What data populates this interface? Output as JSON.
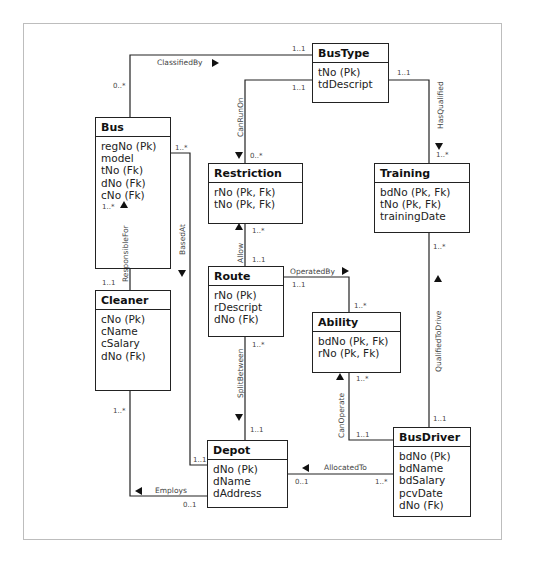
{
  "diagram": {
    "type": "UML class diagram (ER)",
    "entities": {
      "bus": {
        "name": "Bus",
        "attributes": [
          "regNo (Pk)",
          "model",
          "tNo (Fk)",
          "dNo (Fk)",
          "cNo (Fk)"
        ]
      },
      "bustype": {
        "name": "BusType",
        "attributes": [
          "tNo (Pk)",
          "tdDescript"
        ]
      },
      "restriction": {
        "name": "Restriction",
        "attributes": [
          "rNo (Pk, Fk)",
          "tNo (Pk, Fk)"
        ]
      },
      "training": {
        "name": "Training",
        "attributes": [
          "bdNo (Pk, Fk)",
          "tNo (Pk, Fk)",
          "trainingDate"
        ]
      },
      "route": {
        "name": "Route",
        "attributes": [
          "rNo (Pk)",
          "rDescript",
          "dNo (Fk)"
        ]
      },
      "ability": {
        "name": "Ability",
        "attributes": [
          "bdNo (Pk, Fk)",
          "rNo (Pk, Fk)"
        ]
      },
      "cleaner": {
        "name": "Cleaner",
        "attributes": [
          "cNo (Pk)",
          "cName",
          "cSalary",
          "dNo (Fk)"
        ]
      },
      "depot": {
        "name": "Depot",
        "attributes": [
          "dNo (Pk)",
          "dName",
          "dAddress"
        ]
      },
      "busdriver": {
        "name": "BusDriver",
        "attributes": [
          "bdNo (Pk)",
          "bdName",
          "bdSalary",
          "pcvDate",
          "dNo (Fk)"
        ]
      }
    },
    "relationships": {
      "classifiedby": {
        "label": "ClassifiedBy",
        "from": "Bus",
        "to": "BusType",
        "from_mult": "0..*",
        "to_mult": "1..1"
      },
      "canrunon": {
        "label": "CanRunOn",
        "from": "BusType",
        "to": "Restriction",
        "from_mult": "1..1",
        "to_mult": "0..*"
      },
      "hasqualified": {
        "label": "HasQualified",
        "from": "BusType",
        "to": "Training",
        "from_mult": "1..1",
        "to_mult": "1..*"
      },
      "basedat": {
        "label": "BasedAt",
        "from": "Bus",
        "to": "Depot",
        "from_mult": "1..*",
        "to_mult": "1..1"
      },
      "responsiblefor": {
        "label": "ResponsibleFor",
        "from": "Cleaner",
        "to": "Bus",
        "from_mult": "1..1",
        "to_mult": "1..*"
      },
      "allow": {
        "label": "Allow",
        "from": "Route",
        "to": "Restriction",
        "from_mult": "1..1",
        "to_mult": "1..*"
      },
      "operatedby": {
        "label": "OperatedBy",
        "from": "Route",
        "to": "Ability",
        "from_mult": "1..1",
        "to_mult": "1..*"
      },
      "splitbetween": {
        "label": "SplitBetween",
        "from": "Route",
        "to": "Depot",
        "from_mult": "1..*",
        "to_mult": "1..1"
      },
      "qualifiedtodrive": {
        "label": "QualifiedToDrive",
        "from": "BusDriver",
        "to": "Training",
        "from_mult": "1..1",
        "to_mult": "1..*"
      },
      "canoperate": {
        "label": "CanOperate",
        "from": "BusDriver",
        "to": "Ability",
        "from_mult": "1..1",
        "to_mult": "1..*"
      },
      "allocatedto": {
        "label": "AllocatedTo",
        "from": "BusDriver",
        "to": "Depot",
        "from_mult": "1..*",
        "to_mult": "0..1"
      },
      "employs": {
        "label": "Employs",
        "from": "Depot",
        "to": "Cleaner",
        "from_mult": "0..1",
        "to_mult": "1..*"
      }
    }
  }
}
